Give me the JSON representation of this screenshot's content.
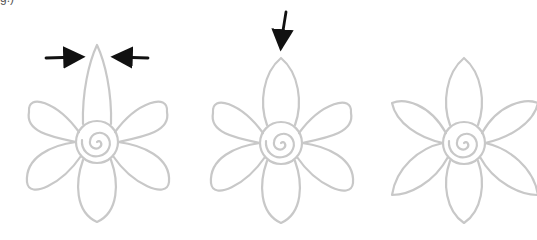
{
  "caption_fragment": "g.)",
  "colors": {
    "outline": "#c8c8c8",
    "arrow": "#111111",
    "background": "#ffffff"
  },
  "flowers": [
    {
      "id": "step-1",
      "description": "Six-petal flower with tall narrow pointed top petal; two arrows point inward toward the top petal tip",
      "center": [
        97,
        142
      ],
      "top_petal": "narrow-pointed",
      "other_petals": "rounded",
      "arrows": [
        {
          "direction": "right",
          "from": [
            46,
            57
          ],
          "to": [
            82,
            57
          ]
        },
        {
          "direction": "left",
          "from": [
            148,
            57
          ],
          "to": [
            114,
            57
          ]
        }
      ]
    },
    {
      "id": "step-2",
      "description": "Six-petal flower with shorter pointed top petal; arrow points down to top petal tip",
      "center": [
        281,
        143
      ],
      "top_petal": "short-pointed",
      "other_petals": "rounded",
      "arrows": [
        {
          "direction": "down",
          "from": [
            285,
            12
          ],
          "to": [
            281,
            48
          ]
        }
      ]
    },
    {
      "id": "step-3",
      "description": "Six-petal flower with all petals pointed",
      "center": [
        464,
        143
      ],
      "top_petal": "short-pointed",
      "other_petals": "pointed",
      "arrows": []
    }
  ]
}
